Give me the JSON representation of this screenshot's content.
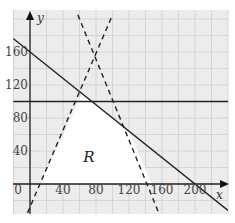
{
  "chart_data": {
    "type": "line",
    "title": "",
    "xlabel": "x",
    "ylabel": "y",
    "xlim": [
      -20,
      240
    ],
    "ylim": [
      -40,
      210
    ],
    "grid": true,
    "grid_step": 20,
    "x_ticks": [
      0,
      40,
      80,
      120,
      160,
      200
    ],
    "y_ticks": [
      40,
      80,
      120,
      160
    ],
    "x_tick_labels": [
      "0",
      "40",
      "80",
      "120",
      "160",
      "200"
    ],
    "y_tick_labels": [
      "40",
      "80",
      "120",
      "160"
    ],
    "series": [
      {
        "name": "solid line (x + 1.25y = 200)",
        "style": "solid",
        "points": [
          [
            -20,
            176
          ],
          [
            240,
            -32
          ]
        ]
      },
      {
        "name": "solid line y = 100",
        "style": "solid",
        "points": [
          [
            -20,
            100
          ],
          [
            240,
            100
          ]
        ]
      },
      {
        "name": "dashed line rising",
        "style": "dashed",
        "points": [
          [
            -3,
            -35
          ],
          [
            100,
            205
          ]
        ]
      },
      {
        "name": "dashed line falling",
        "style": "dashed",
        "points": [
          [
            58,
            205
          ],
          [
            156,
            -35
          ]
        ]
      }
    ],
    "shaded_region": {
      "label": "R",
      "label_position": [
        72,
        32
      ],
      "vertices": [
        [
          13,
          0
        ],
        [
          63,
          110
        ],
        [
          75,
          100
        ],
        [
          120,
          64
        ],
        [
          148,
          0
        ]
      ]
    }
  },
  "labels": {
    "x_axis": "x",
    "y_axis": "y",
    "region": "R",
    "origin": "0",
    "x_ticks": [
      "40",
      "80",
      "120",
      "160",
      "200"
    ],
    "y_ticks": [
      "40",
      "80",
      "120",
      "160"
    ]
  },
  "colors": {
    "grid_bg": "#ececec",
    "grid_line": "#d0d0d0",
    "axis": "#222222",
    "line": "#222222",
    "region_fill": "#ffffff"
  }
}
